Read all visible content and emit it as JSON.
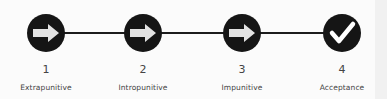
{
  "diagram": {
    "type": "process-timeline",
    "colors": {
      "circle": "#151515",
      "arrow": "#e3e3e3",
      "check": "#ffffff",
      "line": "#1c1c1c",
      "text": "#444444"
    },
    "steps": [
      {
        "number": "1",
        "label": "Extrapunitive",
        "icon": "arrow-right-icon",
        "x": 46
      },
      {
        "number": "2",
        "label": "Intropunitive",
        "icon": "arrow-right-icon",
        "x": 143
      },
      {
        "number": "3",
        "label": "Impunitive",
        "icon": "arrow-right-icon",
        "x": 242
      },
      {
        "number": "4",
        "label": "Acceptance",
        "icon": "checkmark-icon",
        "x": 342
      }
    ]
  }
}
